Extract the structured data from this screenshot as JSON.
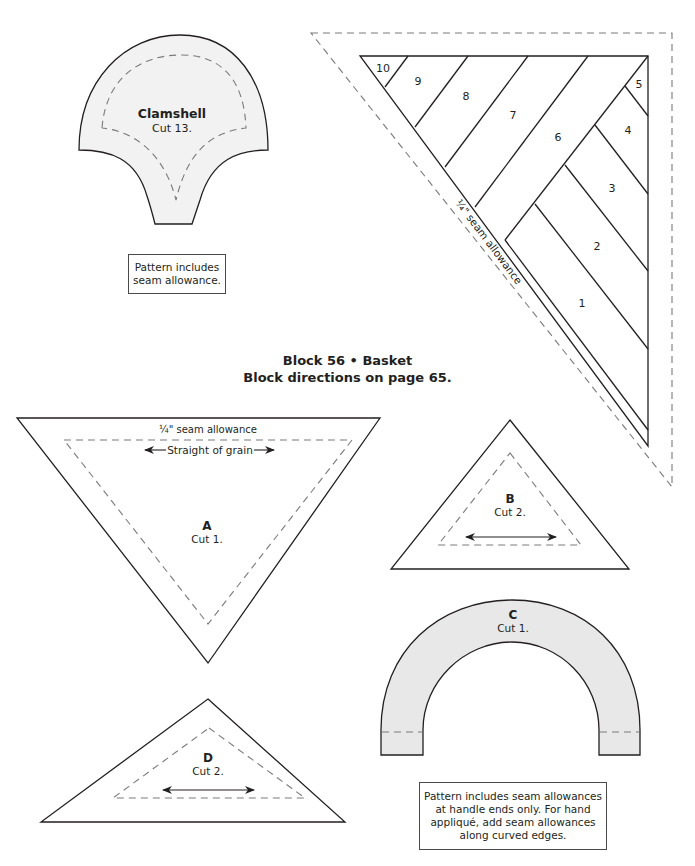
{
  "heading": {
    "title": "Block 56 • Basket",
    "subtitle": "Block directions on page 65."
  },
  "clamshell": {
    "name": "Clamshell",
    "cut": "Cut 13.",
    "fill": "#f2f2f2",
    "note": "Pattern includes seam allowance."
  },
  "foundation": {
    "segments": [
      "10",
      "9",
      "8",
      "7",
      "6",
      "5",
      "4",
      "3",
      "2",
      "1"
    ],
    "seam_label": "¼\" seam allowance"
  },
  "piece_a": {
    "letter": "A",
    "cut": "Cut 1.",
    "seam_label": "¼\" seam allowance",
    "grain_label": "Straight of grain"
  },
  "piece_b": {
    "letter": "B",
    "cut": "Cut 2."
  },
  "piece_c": {
    "letter": "C",
    "cut": "Cut 1.",
    "fill": "#e8e8e8",
    "note_lines": [
      "Pattern includes seam allowances",
      "at handle ends only. For hand",
      "appliqué, add seam allowances",
      "along curved edges."
    ]
  },
  "piece_d": {
    "letter": "D",
    "cut": "Cut 2."
  },
  "colors": {
    "line": "#231f20",
    "dash": "#7a7a7a"
  }
}
